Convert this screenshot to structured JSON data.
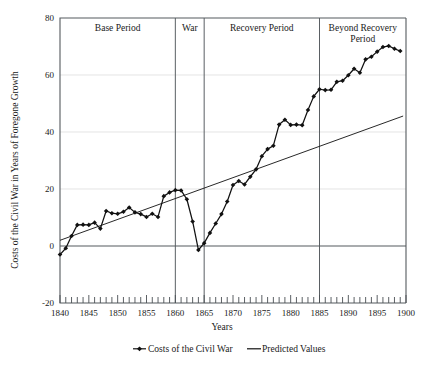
{
  "chart_data": {
    "type": "line",
    "title": "",
    "xlabel": "Years",
    "ylabel": "Costs of the Civil War in Years of Foregone Growth",
    "xlim": [
      1840,
      1900
    ],
    "ylim": [
      -20,
      80
    ],
    "xticks": [
      1840,
      1845,
      1850,
      1855,
      1860,
      1865,
      1870,
      1875,
      1880,
      1885,
      1890,
      1895,
      1900
    ],
    "xtick_labels": [
      "1840",
      "1845",
      "1850",
      "1855",
      "1860",
      "1865",
      "1870",
      "1875",
      "1880",
      "1885",
      "1890",
      "1895",
      "1900"
    ],
    "yticks": [
      -20,
      0,
      20,
      40,
      60,
      80
    ],
    "ytick_labels": [
      "-20",
      "0",
      "20",
      "40",
      "60",
      "80"
    ],
    "minor_xtick_interval": 1,
    "grid": "horizontal-light",
    "legend_position": "bottom",
    "x": [
      1840,
      1841,
      1842,
      1843,
      1844,
      1845,
      1846,
      1847,
      1848,
      1849,
      1850,
      1851,
      1852,
      1853,
      1854,
      1855,
      1856,
      1857,
      1858,
      1859,
      1860,
      1861,
      1862,
      1863,
      1864,
      1865,
      1866,
      1867,
      1868,
      1869,
      1870,
      1871,
      1872,
      1873,
      1874,
      1875,
      1876,
      1877,
      1878,
      1879,
      1880,
      1881,
      1882,
      1883,
      1884,
      1885,
      1886,
      1887,
      1888,
      1889,
      1890,
      1891,
      1892,
      1893,
      1894,
      1895,
      1896,
      1897,
      1898,
      1899
    ],
    "series": [
      {
        "name": "Costs of the Civil War",
        "marker": "filled-diamond",
        "color": "#111111",
        "values": [
          -3.0,
          -0.8,
          3.5,
          7.4,
          7.5,
          7.4,
          8.2,
          6.1,
          12.3,
          11.5,
          11.3,
          12.0,
          13.5,
          11.8,
          11.2,
          10.2,
          11.3,
          10.2,
          17.5,
          18.8,
          19.6,
          19.5,
          16.4,
          8.6,
          -1.4,
          1.0,
          4.6,
          7.9,
          11.2,
          15.6,
          21.4,
          22.8,
          21.6,
          24.3,
          26.9,
          31.5,
          34.0,
          35.2,
          42.6,
          44.3,
          42.5,
          42.6,
          42.4,
          47.7,
          52.5,
          55.0,
          54.7,
          54.8,
          57.6,
          58.0,
          59.9,
          62.2,
          60.8,
          65.5,
          66.4,
          68.2,
          69.8,
          70.2,
          69.2,
          68.4
        ]
      },
      {
        "name": "Predicted Values",
        "marker": "none",
        "color": "#1c1c1c",
        "type": "trend",
        "endpoints": [
          {
            "x": 1840,
            "y": 2.0
          },
          {
            "x": 1899.5,
            "y": 45.6
          }
        ]
      }
    ],
    "period_bands": [
      {
        "label": "Base Period",
        "x_start": 1840,
        "x_end": 1860
      },
      {
        "label": "War",
        "x_start": 1860,
        "x_end": 1865
      },
      {
        "label": "Recovery Period",
        "x_start": 1865,
        "x_end": 1885
      },
      {
        "label": "Beyond Recovery Period",
        "x_start": 1885,
        "x_end": 1900
      }
    ],
    "divider_years": [
      1860,
      1865,
      1885
    ],
    "legend": [
      {
        "label": "Costs of the Civil War",
        "marker": "line-with-diamond"
      },
      {
        "label": "Predicted Values",
        "marker": "line"
      }
    ]
  }
}
